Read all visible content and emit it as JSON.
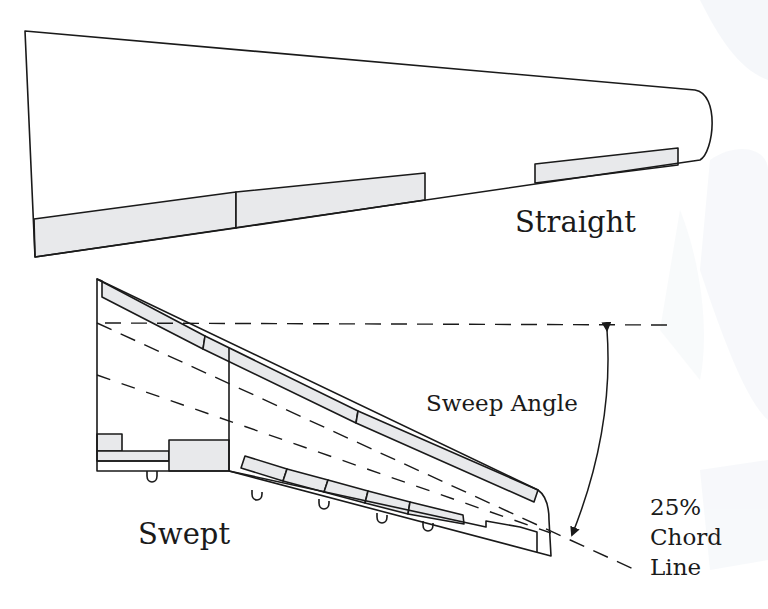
{
  "diagram": {
    "type": "wing-planform-comparison",
    "colors": {
      "outline": "#1a1a1a",
      "control_surface_fill": "#e8e9eb",
      "background": "#ffffff",
      "watermark": "#eef2f7"
    },
    "wings": [
      {
        "id": "straight",
        "label": "Straight",
        "control_surfaces": [
          "inboard-flap",
          "outboard-flap",
          "aileron"
        ]
      },
      {
        "id": "swept",
        "label": "Swept",
        "control_surfaces": [
          "leading-edge-slats",
          "inboard-flap",
          "outboard-flaps",
          "aileron",
          "flap-track-fairings"
        ]
      }
    ],
    "annotations": {
      "sweep_angle": "Sweep Angle",
      "chord_line": [
        "25%",
        "Chord",
        "Line"
      ]
    }
  }
}
